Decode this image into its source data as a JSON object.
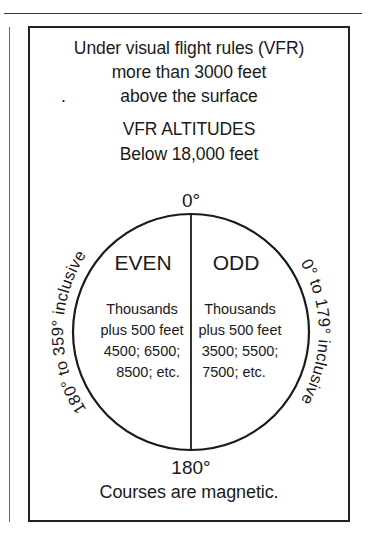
{
  "figure": {
    "header_lines": [
      "Under visual flight rules (VFR)",
      "more than 3000 feet",
      "above the surface"
    ],
    "stray_mark": ".",
    "title_lines": [
      "VFR ALTITUDES",
      "Below 18,000 feet"
    ],
    "footer_line": "Courses are magnetic.",
    "top_degree_label": "0°",
    "bottom_degree_label": "180°",
    "left_arc_label": "180° to 359° inclusive",
    "right_arc_label": "0° to 179° inclusive",
    "left_half": {
      "heading": "EVEN",
      "detail_lines": [
        "Thousands",
        "plus 500 feet",
        "4500; 6500;",
        "8500; etc."
      ]
    },
    "right_half": {
      "heading": "ODD",
      "detail_lines": [
        "Thousands",
        "plus 500 feet",
        "3500; 5500;",
        "7500; etc."
      ]
    }
  },
  "colors": {
    "ink": "#1a1a1a",
    "frame": "#222222",
    "paper": "#ffffff",
    "rule": "#3a3a3a"
  }
}
